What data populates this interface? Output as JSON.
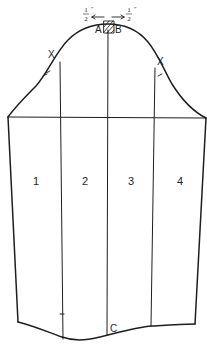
{
  "diagram": {
    "type": "sleeve-pattern",
    "colors": {
      "ink": "#1e1e1e",
      "background": "#ffffff"
    },
    "panels": [
      {
        "id": "1",
        "label": "1"
      },
      {
        "id": "2",
        "label": "2"
      },
      {
        "id": "3",
        "label": "3"
      },
      {
        "id": "4",
        "label": "4"
      }
    ],
    "points": {
      "A": "A",
      "B": "B",
      "C": "C",
      "X_left": "X",
      "X_right": "X"
    },
    "measurements": {
      "left_fraction_num": "1",
      "left_fraction_den": "2",
      "left_unit": "\"",
      "right_fraction_num": "1",
      "right_fraction_den": "2",
      "right_unit": "\""
    }
  }
}
